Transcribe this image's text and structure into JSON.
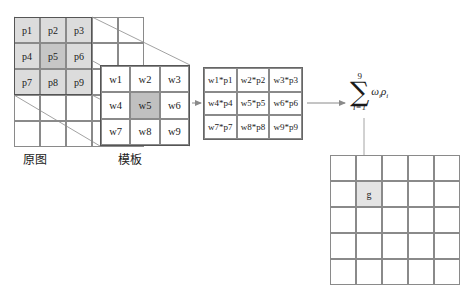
{
  "diagram": {
    "source_grid": {
      "rows": 5,
      "cols": 5,
      "label": "原图",
      "highlighted_window": [
        "p1",
        "p2",
        "p3",
        "p4",
        "p5",
        "p6",
        "p7",
        "p8",
        "p9"
      ],
      "center_cell": "p5",
      "cells": [
        [
          "p1",
          "p2",
          "p3",
          "",
          ""
        ],
        [
          "p4",
          "p5",
          "p6",
          "",
          ""
        ],
        [
          "p7",
          "p8",
          "p9",
          "",
          ""
        ],
        [
          "",
          "",
          "",
          "",
          ""
        ],
        [
          "",
          "",
          "",
          "",
          ""
        ]
      ]
    },
    "template_grid": {
      "rows": 3,
      "cols": 3,
      "label": "模板",
      "center_cell": "w5",
      "cells": [
        [
          "w1",
          "w2",
          "w3"
        ],
        [
          "w4",
          "w5",
          "w6"
        ],
        [
          "w7",
          "w8",
          "w9"
        ]
      ]
    },
    "product_grid": {
      "rows": 3,
      "cols": 3,
      "cells": [
        [
          "w1*p1",
          "w2*p2",
          "w3*p3"
        ],
        [
          "w4*p4",
          "w5*p5",
          "w6*p6"
        ],
        [
          "w7*p7",
          "w8*p8",
          "w9*p9"
        ]
      ]
    },
    "summation": {
      "upper_limit": "9",
      "sigma": "∑",
      "lower_limit": "i=1",
      "term": "ω",
      "term_sub": "i",
      "term2": "ρ",
      "term2_sub": "i"
    },
    "output_grid": {
      "rows": 5,
      "cols": 5,
      "result_cell": "g",
      "result_row": 2,
      "result_col": 2,
      "cells": [
        [
          "",
          "",
          "",
          "",
          ""
        ],
        [
          "",
          "g",
          "",
          "",
          ""
        ],
        [
          "",
          "",
          "",
          "",
          ""
        ],
        [
          "",
          "",
          "",
          "",
          ""
        ],
        [
          "",
          "",
          "",
          "",
          ""
        ]
      ]
    },
    "colors": {
      "window_fill": "#dcdcdc",
      "center_fill": "#c0c0c0",
      "grid_line": "#8a8a8a",
      "heavy_line": "#555555",
      "result_fill": "#e4e4e4"
    }
  }
}
